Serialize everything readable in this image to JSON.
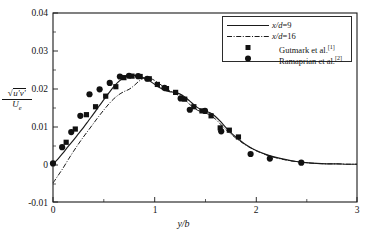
{
  "chart_data": {
    "type": "line",
    "title": "",
    "xlabel": "y/b",
    "ylabel_numerator": "sqrt(u'v')",
    "ylabel_denominator": "U_e",
    "xlim": [
      0,
      3
    ],
    "ylim": [
      -0.01,
      0.04
    ],
    "xticks": [
      "0",
      "1",
      "2",
      "3"
    ],
    "xtick_values": [
      0,
      1,
      2,
      3
    ],
    "yticks": [
      "-0.01",
      "0",
      "0.01",
      "0.02",
      "0.03",
      "0.04"
    ],
    "ytick_values": [
      -0.01,
      0,
      0.01,
      0.02,
      0.03,
      0.04
    ],
    "grid": false,
    "legend_position": "top-right",
    "series": [
      {
        "name": "x/d=9",
        "style": "solid-line",
        "x": [
          0.0,
          0.05,
          0.1,
          0.15,
          0.2,
          0.25,
          0.3,
          0.35,
          0.4,
          0.45,
          0.5,
          0.55,
          0.6,
          0.65,
          0.7,
          0.75,
          0.8,
          0.85,
          0.9,
          0.95,
          1.0,
          1.05,
          1.1,
          1.15,
          1.2,
          1.25,
          1.3,
          1.35,
          1.4,
          1.45,
          1.5,
          1.55,
          1.6,
          1.65,
          1.7,
          1.75,
          1.8,
          1.85,
          1.9,
          1.95,
          2.0,
          2.1,
          2.2,
          2.3,
          2.4,
          2.5,
          2.6,
          2.7,
          2.8,
          2.9,
          3.0
        ],
        "y": [
          0.0,
          0.0014,
          0.003,
          0.0047,
          0.0063,
          0.008,
          0.0097,
          0.0115,
          0.0133,
          0.0152,
          0.017,
          0.0188,
          0.0205,
          0.0219,
          0.0229,
          0.0234,
          0.0235,
          0.0233,
          0.0228,
          0.0221,
          0.0212,
          0.0203,
          0.0196,
          0.0192,
          0.019,
          0.0186,
          0.0178,
          0.0167,
          0.0155,
          0.0146,
          0.0141,
          0.0136,
          0.0127,
          0.0114,
          0.0099,
          0.0085,
          0.0073,
          0.0062,
          0.0052,
          0.0044,
          0.0037,
          0.0026,
          0.0018,
          0.0012,
          0.0007,
          0.0004,
          0.0002,
          0.0001,
          0.0001,
          0.0,
          0.0
        ]
      },
      {
        "name": "x/d=16",
        "style": "dash-dot-line",
        "x": [
          0.0,
          0.05,
          0.1,
          0.15,
          0.2,
          0.25,
          0.3,
          0.35,
          0.4,
          0.45,
          0.5,
          0.55,
          0.6,
          0.65,
          0.7,
          0.75,
          0.8,
          0.85,
          0.9,
          0.95,
          1.0,
          1.05,
          1.1,
          1.15,
          1.2,
          1.25,
          1.3,
          1.35,
          1.4,
          1.45,
          1.5,
          1.55,
          1.6,
          1.65,
          1.7,
          1.75,
          1.8,
          1.85,
          1.9,
          1.95,
          2.0,
          2.1,
          2.2,
          2.3,
          2.4,
          2.5,
          2.6,
          2.7,
          2.8,
          2.9,
          3.0
        ],
        "y": [
          -0.005,
          -0.003,
          -0.001,
          0.0012,
          0.0033,
          0.0053,
          0.0072,
          0.009,
          0.0108,
          0.0126,
          0.0143,
          0.0159,
          0.0173,
          0.0184,
          0.0192,
          0.0198,
          0.0208,
          0.022,
          0.0228,
          0.0228,
          0.0222,
          0.0213,
          0.0203,
          0.0195,
          0.0188,
          0.018,
          0.017,
          0.0158,
          0.0147,
          0.014,
          0.0136,
          0.013,
          0.012,
          0.0107,
          0.0093,
          0.0081,
          0.007,
          0.006,
          0.0051,
          0.0043,
          0.0036,
          0.0025,
          0.0017,
          0.0011,
          0.0007,
          0.0004,
          0.0002,
          0.0001,
          0.0001,
          0.0,
          0.0
        ]
      },
      {
        "name": "Gutmark et al.[1]",
        "style": "square-marker",
        "x": [
          0.13,
          0.22,
          0.33,
          0.42,
          0.52,
          0.62,
          0.7,
          0.78,
          0.86,
          0.95,
          1.03,
          1.12,
          1.21,
          1.3,
          1.39,
          1.47,
          1.56,
          1.65,
          1.74,
          1.83
        ],
        "y": [
          0.0058,
          0.0093,
          0.0131,
          0.0152,
          0.018,
          0.0205,
          0.0229,
          0.0233,
          0.0232,
          0.0226,
          0.0211,
          0.02,
          0.019,
          0.0172,
          0.0152,
          0.0141,
          0.0128,
          0.0096,
          0.009,
          0.0072
        ]
      },
      {
        "name": "Ramaprian et al.[2]",
        "style": "circle-marker",
        "x": [
          0.0,
          0.09,
          0.18,
          0.27,
          0.36,
          0.46,
          0.56,
          0.66,
          0.75,
          0.84,
          0.93,
          1.1,
          1.26,
          1.35,
          1.5,
          1.66,
          1.95,
          2.14,
          2.45
        ],
        "y": [
          0.0002,
          0.0045,
          0.0085,
          0.0128,
          0.0185,
          0.0198,
          0.0215,
          0.0232,
          0.0234,
          0.0233,
          0.0226,
          0.0202,
          0.0174,
          0.0144,
          0.0141,
          0.0087,
          0.0027,
          0.0015,
          0.0004
        ]
      }
    ]
  },
  "axes": {
    "x_label": "y/b",
    "y_label_numerator_radical": "u'v'",
    "y_label_denominator": "U",
    "y_label_denominator_sub": "e",
    "x_tick_labels": [
      "0",
      "1",
      "2",
      "3"
    ],
    "y_tick_labels": [
      "0.04",
      "0.03",
      "0.02",
      "0.01",
      "0",
      "-0.01"
    ]
  },
  "legend": {
    "entries": [
      {
        "label_prefix": "x/d",
        "label_suffix": "=9",
        "full": "x/d=9",
        "style": "solid-line",
        "ref": ""
      },
      {
        "label_prefix": "x/d",
        "label_suffix": "=16",
        "full": "x/d=16",
        "style": "dash-dot-line",
        "ref": ""
      },
      {
        "label_prefix": "Gutmark et al.",
        "label_suffix": "",
        "full": "Gutmark et al.[1]",
        "style": "square-marker",
        "ref": "[1]"
      },
      {
        "label_prefix": "Ramaprian et al.",
        "label_suffix": "",
        "full": "Ramaprian et al.[2]",
        "style": "circle-marker",
        "ref": "[2]"
      }
    ]
  },
  "colors": {
    "axis": "#1a1a1a",
    "curve": "#1a1a1a",
    "marker": "#111111",
    "background": "#ffffff"
  }
}
